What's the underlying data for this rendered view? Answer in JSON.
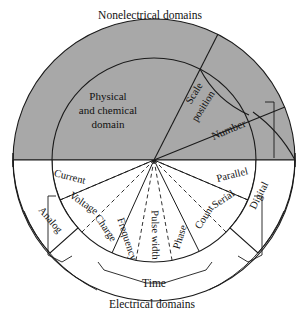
{
  "figure": {
    "title_top": "Nonelectrical domains",
    "title_bottom": "Electrical domains",
    "center_label_line1": "Physical",
    "center_label_line2": "and chemical",
    "center_label_line3": "domain"
  },
  "colors": {
    "shaded_region": "#a8a8a8",
    "background": "#ffffff",
    "stroke": "#1a1a1a",
    "text": "#111111"
  },
  "geometry": {
    "center_x": 154,
    "center_y": 160,
    "outer_radius": 141,
    "inner_radius": 101,
    "core_radius": 102
  },
  "upper_sectors": [
    {
      "id": "scale-position",
      "label_line1": "Scale",
      "label_line2": "position",
      "start_deg": 63,
      "end_deg": 86
    },
    {
      "id": "number",
      "label_line1": "Number",
      "label_line2": "",
      "start_deg": 22,
      "end_deg": 63
    }
  ],
  "lower_sectors": [
    {
      "id": "current",
      "label": "Current",
      "start_deg": 157,
      "end_deg": 180,
      "divider": "dashed"
    },
    {
      "id": "voltage",
      "label": "Voltage",
      "start_deg": 135,
      "end_deg": 157,
      "divider": "dashed"
    },
    {
      "id": "charge",
      "label": "Charge",
      "start_deg": 114,
      "end_deg": 135,
      "divider": "solid"
    },
    {
      "id": "frequency",
      "label": "Frequency",
      "start_deg": 100,
      "end_deg": 114,
      "divider": "dashed"
    },
    {
      "id": "pulse-width",
      "label": "Pulse width",
      "start_deg": 80,
      "end_deg": 100,
      "divider": "dashed"
    },
    {
      "id": "phase",
      "label": "Phase",
      "start_deg": 64,
      "end_deg": 80,
      "divider": "solid"
    },
    {
      "id": "count",
      "label": "Count",
      "start_deg": 45,
      "end_deg": 64,
      "divider": "dashed"
    },
    {
      "id": "serial",
      "label": "Serial",
      "start_deg": 23,
      "end_deg": 45,
      "divider": "dashed"
    },
    {
      "id": "parallel",
      "label": "Parallel",
      "start_deg": 0,
      "end_deg": 23,
      "divider": "solid"
    }
  ],
  "ring_labels": [
    {
      "id": "analog",
      "label": "Analog",
      "angle_deg": 146
    },
    {
      "id": "digital",
      "label": "Digital",
      "angle_deg": 22
    }
  ],
  "bracket_labels": [
    {
      "id": "time-bracket",
      "label": "Time"
    },
    {
      "id": "analog-bracket",
      "label": ""
    },
    {
      "id": "digital-bracket",
      "label": ""
    }
  ]
}
